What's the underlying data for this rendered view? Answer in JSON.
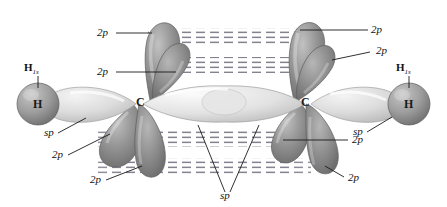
{
  "figure": {
    "background_color": "#ffffff",
    "orbital_dark_color": "#8c8c8c",
    "orbital_light_color": "#d8d8d8",
    "outline_color": "#5a5a5a",
    "leader_color": "#1a1a1a",
    "dash_color": "#7d7d8a",
    "label_color": "#111111"
  },
  "atoms": {
    "hydrogen_left": "H",
    "hydrogen_right": "H",
    "carbon_left": "C",
    "carbon_right": "C"
  },
  "labels": {
    "h1s_left": {
      "text": "H",
      "sub": "1s"
    },
    "h1s_right": {
      "text": "H",
      "sub": "1s"
    },
    "sp_left": "sp",
    "sp_right": "sp",
    "sp_center": "sp",
    "p_top_left_outer": "2p",
    "p_top_left_inner": "2p",
    "p_top_right_outer": "2p",
    "p_top_right_inner": "2p",
    "p_bottom_left_inner": "2p",
    "p_bottom_left_outer": "2p",
    "p_bottom_right_inner": "2p",
    "p_bottom_right_outer": "2p"
  }
}
